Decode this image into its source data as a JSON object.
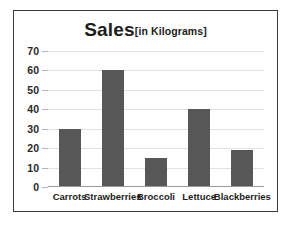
{
  "chart_data": {
    "type": "bar",
    "title": "Sales",
    "subtitle": "[in Kilograms]",
    "title_full": "Sales[in Kilograms]",
    "xlabel": "",
    "ylabel": "",
    "categories": [
      "Carrots",
      "Strawberries",
      "Broccoli",
      "Lettuce",
      "Blackberries"
    ],
    "values": [
      30,
      60,
      15,
      40,
      19
    ],
    "ylim": [
      0,
      70
    ],
    "y_ticks": [
      0,
      10,
      20,
      30,
      40,
      50,
      60,
      70
    ],
    "y_tick_labels": [
      "0",
      "10",
      "20",
      "30",
      "40",
      "50",
      "60",
      "70"
    ],
    "grid": true,
    "legend": false,
    "legend_position": "none",
    "bar_color": "#575757",
    "gridline_color": "#e2e2e2",
    "axis_color": "#9a9a9a",
    "frame_color": "#3b3b3b",
    "background_color": "#ffffff",
    "text_color": "#1d1d1d"
  }
}
